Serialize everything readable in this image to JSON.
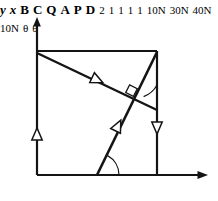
{
  "figure": {
    "axes": {
      "x_label": "x",
      "y_label": "y"
    },
    "vertices": [
      {
        "id": "A",
        "label": "A",
        "x": 37,
        "y": 175
      },
      {
        "id": "B",
        "label": "B",
        "x": 37,
        "y": 51
      },
      {
        "id": "C",
        "label": "C",
        "x": 157,
        "y": 51
      },
      {
        "id": "D",
        "label": "D",
        "x": 157,
        "y": 175
      },
      {
        "id": "P",
        "label": "P",
        "x": 97,
        "y": 175
      },
      {
        "id": "Q",
        "label": "Q",
        "x": 157,
        "y": 110
      }
    ],
    "dimensions": [
      {
        "id": "bc-length",
        "label": "2",
        "x": 96,
        "y": 36
      },
      {
        "id": "ap-length",
        "label": "1",
        "x": 66,
        "y": 182
      },
      {
        "id": "pd-length",
        "label": "1",
        "x": 127,
        "y": 182
      },
      {
        "id": "cq-length",
        "label": "1",
        "x": 163,
        "y": 72
      },
      {
        "id": "qd-length",
        "label": "1",
        "x": 163,
        "y": 150
      }
    ],
    "forces": [
      {
        "id": "force-ab",
        "label": "10N",
        "x": 8,
        "y": 107,
        "magnitude": 10,
        "unit": "N",
        "direction": "up",
        "member": "AB"
      },
      {
        "id": "force-bq",
        "label": "30N",
        "x": 80,
        "y": 92,
        "magnitude": 30,
        "unit": "N",
        "direction": "down-right",
        "member": "BQ"
      },
      {
        "id": "force-pc",
        "label": "40N",
        "x": 83,
        "y": 128,
        "magnitude": 40,
        "unit": "N",
        "direction": "up-right",
        "member": "PC"
      },
      {
        "id": "force-qd",
        "label": "10N",
        "x": 165,
        "y": 122,
        "magnitude": 10,
        "unit": "N",
        "direction": "down",
        "member": "QD"
      }
    ],
    "angles": [
      {
        "id": "angle-at-q",
        "label": "θ",
        "x": 149,
        "y": 97
      },
      {
        "id": "angle-at-p",
        "label": "θ",
        "x": 108,
        "y": 161
      }
    ],
    "markers": [
      {
        "id": "right-angle-at-intersection",
        "x": 131,
        "y": 92,
        "type": "right-angle-square"
      }
    ],
    "colors": {
      "stroke": "#141414",
      "text": "#141414",
      "background": "#ffffff"
    }
  }
}
